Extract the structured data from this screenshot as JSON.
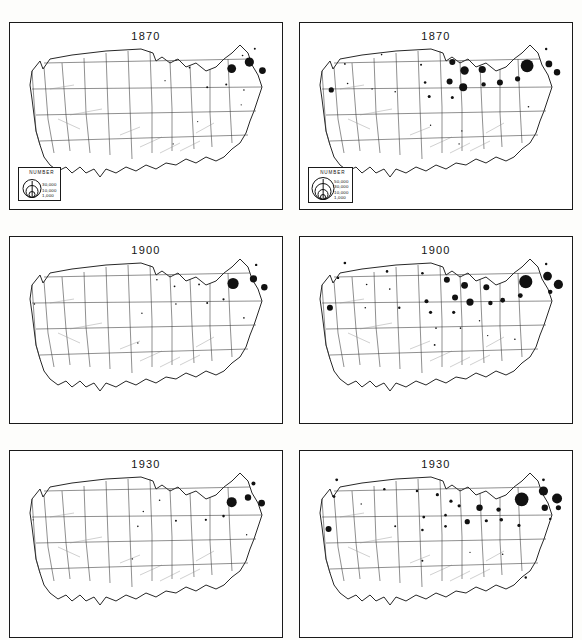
{
  "figure": {
    "title": "",
    "columns": [
      "left",
      "right"
    ],
    "rows": [
      "1870",
      "1900",
      "1930"
    ]
  },
  "chart_data": {
    "type": "scatter",
    "subtitle": "Proportional-symbol maps, two series, three time periods",
    "xlabel": "",
    "ylabel": "",
    "grid": false,
    "legend_position": "lower-left of top panels",
    "panels": [
      {
        "id": "p-1870-left",
        "row": 0,
        "col": 0,
        "title": "1870",
        "legend": {
          "title": "NUMBER",
          "entries": [
            "30,000",
            "10,000",
            "1,000"
          ],
          "values": [
            30000,
            10000,
            1000
          ]
        },
        "points": [
          {
            "x": 81.5,
            "y": 24.5,
            "r": 4.4
          },
          {
            "x": 88.0,
            "y": 21.0,
            "r": 4.6
          },
          {
            "x": 92.8,
            "y": 25.6,
            "r": 3.4
          },
          {
            "x": 90.0,
            "y": 13.8,
            "r": 1.0
          },
          {
            "x": 85.5,
            "y": 17.5,
            "r": 0.8
          },
          {
            "x": 79.5,
            "y": 33.0,
            "r": 1.0
          },
          {
            "x": 72.5,
            "y": 34.5,
            "r": 1.0
          },
          {
            "x": 86.0,
            "y": 36.0,
            "r": 0.8
          },
          {
            "x": 66.0,
            "y": 24.0,
            "r": 0.8
          },
          {
            "x": 61.0,
            "y": 20.0,
            "r": 0.7
          },
          {
            "x": 57.0,
            "y": 31.0,
            "r": 0.6
          },
          {
            "x": 69.0,
            "y": 53.0,
            "r": 0.6
          },
          {
            "x": 60.0,
            "y": 65.0,
            "r": 0.6
          },
          {
            "x": 85.0,
            "y": 44.0,
            "r": 0.6
          }
        ]
      },
      {
        "id": "p-1870-right",
        "row": 0,
        "col": 1,
        "title": "1870",
        "legend": {
          "title": "NUMBER",
          "entries": [
            "50,000",
            "30,000",
            "10,000",
            "1,000"
          ],
          "values": [
            50000,
            30000,
            10000,
            1000
          ]
        },
        "points": [
          {
            "x": 83.5,
            "y": 23.0,
            "r": 6.4
          },
          {
            "x": 91.5,
            "y": 22.0,
            "r": 3.4
          },
          {
            "x": 94.5,
            "y": 26.5,
            "r": 3.2
          },
          {
            "x": 90.5,
            "y": 14.0,
            "r": 1.2
          },
          {
            "x": 56.0,
            "y": 21.0,
            "r": 3.0
          },
          {
            "x": 60.5,
            "y": 25.5,
            "r": 4.2
          },
          {
            "x": 67.0,
            "y": 25.0,
            "r": 3.6
          },
          {
            "x": 55.0,
            "y": 31.5,
            "r": 3.0
          },
          {
            "x": 60.0,
            "y": 34.5,
            "r": 4.0
          },
          {
            "x": 67.5,
            "y": 33.0,
            "r": 2.2
          },
          {
            "x": 73.5,
            "y": 32.0,
            "r": 3.0
          },
          {
            "x": 80.0,
            "y": 30.0,
            "r": 2.6
          },
          {
            "x": 11.5,
            "y": 36.0,
            "r": 2.6
          },
          {
            "x": 46.0,
            "y": 32.0,
            "r": 1.3
          },
          {
            "x": 47.5,
            "y": 39.5,
            "r": 1.5
          },
          {
            "x": 56.0,
            "y": 40.0,
            "r": 1.5
          },
          {
            "x": 44.5,
            "y": 22.5,
            "r": 1.0
          },
          {
            "x": 30.0,
            "y": 17.0,
            "r": 0.8
          },
          {
            "x": 16.5,
            "y": 22.0,
            "r": 0.9
          },
          {
            "x": 17.5,
            "y": 32.5,
            "r": 0.8
          },
          {
            "x": 26.5,
            "y": 35.5,
            "r": 0.7
          },
          {
            "x": 35.0,
            "y": 37.0,
            "r": 0.8
          },
          {
            "x": 48.0,
            "y": 55.0,
            "r": 0.7
          },
          {
            "x": 59.5,
            "y": 58.0,
            "r": 0.7
          },
          {
            "x": 58.5,
            "y": 65.0,
            "r": 0.7
          },
          {
            "x": 84.0,
            "y": 45.0,
            "r": 0.8
          }
        ]
      },
      {
        "id": "p-1900-left",
        "row": 1,
        "col": 0,
        "title": "1900",
        "legend": null,
        "points": [
          {
            "x": 82.0,
            "y": 25.0,
            "r": 5.6
          },
          {
            "x": 89.5,
            "y": 22.5,
            "r": 3.6
          },
          {
            "x": 93.5,
            "y": 27.0,
            "r": 3.2
          },
          {
            "x": 90.5,
            "y": 15.0,
            "r": 1.2
          },
          {
            "x": 78.5,
            "y": 33.5,
            "r": 1.1
          },
          {
            "x": 72.5,
            "y": 35.5,
            "r": 1.0
          },
          {
            "x": 69.5,
            "y": 25.5,
            "r": 0.9
          },
          {
            "x": 60.5,
            "y": 26.5,
            "r": 0.9
          },
          {
            "x": 61.0,
            "y": 36.0,
            "r": 0.8
          },
          {
            "x": 54.0,
            "y": 23.0,
            "r": 0.8
          },
          {
            "x": 9.0,
            "y": 36.0,
            "r": 0.7
          },
          {
            "x": 48.5,
            "y": 41.0,
            "r": 0.7
          },
          {
            "x": 47.0,
            "y": 57.0,
            "r": 0.7
          },
          {
            "x": 86.0,
            "y": 43.5,
            "r": 0.8
          }
        ]
      },
      {
        "id": "p-1900-right",
        "row": 1,
        "col": 1,
        "title": "1900",
        "legend": null,
        "points": [
          {
            "x": 83.0,
            "y": 24.0,
            "r": 6.6
          },
          {
            "x": 91.0,
            "y": 21.0,
            "r": 4.4
          },
          {
            "x": 95.0,
            "y": 25.5,
            "r": 4.6
          },
          {
            "x": 92.0,
            "y": 29.5,
            "r": 2.2
          },
          {
            "x": 90.5,
            "y": 14.5,
            "r": 1.2
          },
          {
            "x": 54.0,
            "y": 23.0,
            "r": 3.0
          },
          {
            "x": 60.5,
            "y": 26.0,
            "r": 3.4
          },
          {
            "x": 68.5,
            "y": 27.0,
            "r": 3.0
          },
          {
            "x": 57.0,
            "y": 32.5,
            "r": 3.0
          },
          {
            "x": 62.5,
            "y": 35.0,
            "r": 3.6
          },
          {
            "x": 70.0,
            "y": 35.5,
            "r": 2.2
          },
          {
            "x": 74.5,
            "y": 34.0,
            "r": 2.4
          },
          {
            "x": 81.0,
            "y": 31.5,
            "r": 2.4
          },
          {
            "x": 11.0,
            "y": 38.0,
            "r": 3.0
          },
          {
            "x": 46.5,
            "y": 34.5,
            "r": 2.0
          },
          {
            "x": 48.0,
            "y": 40.5,
            "r": 1.6
          },
          {
            "x": 56.5,
            "y": 40.5,
            "r": 1.6
          },
          {
            "x": 45.0,
            "y": 19.5,
            "r": 1.3
          },
          {
            "x": 32.0,
            "y": 18.5,
            "r": 1.3
          },
          {
            "x": 16.5,
            "y": 14.0,
            "r": 1.3
          },
          {
            "x": 14.0,
            "y": 22.0,
            "r": 1.2
          },
          {
            "x": 24.5,
            "y": 25.5,
            "r": 0.8
          },
          {
            "x": 33.0,
            "y": 28.0,
            "r": 0.8
          },
          {
            "x": 36.5,
            "y": 38.0,
            "r": 1.2
          },
          {
            "x": 24.0,
            "y": 38.0,
            "r": 0.8
          },
          {
            "x": 50.0,
            "y": 49.0,
            "r": 0.8
          },
          {
            "x": 59.0,
            "y": 49.0,
            "r": 0.8
          },
          {
            "x": 49.5,
            "y": 58.0,
            "r": 0.9
          },
          {
            "x": 66.0,
            "y": 45.0,
            "r": 0.7
          },
          {
            "x": 69.0,
            "y": 53.0,
            "r": 0.7
          },
          {
            "x": 79.0,
            "y": 55.0,
            "r": 0.8
          }
        ]
      },
      {
        "id": "p-1930-left",
        "row": 2,
        "col": 0,
        "title": "1930",
        "legend": null,
        "points": [
          {
            "x": 81.5,
            "y": 27.5,
            "r": 5.0
          },
          {
            "x": 87.5,
            "y": 25.0,
            "r": 3.2
          },
          {
            "x": 92.5,
            "y": 28.0,
            "r": 3.4
          },
          {
            "x": 89.5,
            "y": 17.5,
            "r": 2.0
          },
          {
            "x": 78.5,
            "y": 35.0,
            "r": 1.3
          },
          {
            "x": 72.0,
            "y": 37.0,
            "r": 1.1
          },
          {
            "x": 61.0,
            "y": 37.5,
            "r": 1.0
          },
          {
            "x": 55.0,
            "y": 26.5,
            "r": 0.8
          },
          {
            "x": 49.0,
            "y": 32.5,
            "r": 0.7
          },
          {
            "x": 47.0,
            "y": 40.5,
            "r": 0.8
          },
          {
            "x": 8.5,
            "y": 37.0,
            "r": 0.6
          },
          {
            "x": 45.0,
            "y": 58.0,
            "r": 0.7
          },
          {
            "x": 87.0,
            "y": 45.0,
            "r": 0.7
          }
        ]
      },
      {
        "id": "p-1930-right",
        "row": 2,
        "col": 1,
        "title": "1930",
        "legend": null,
        "points": [
          {
            "x": 81.5,
            "y": 26.0,
            "r": 6.8
          },
          {
            "x": 89.5,
            "y": 21.5,
            "r": 4.6
          },
          {
            "x": 94.5,
            "y": 25.5,
            "r": 5.0
          },
          {
            "x": 90.0,
            "y": 30.5,
            "r": 3.2
          },
          {
            "x": 95.0,
            "y": 30.5,
            "r": 2.6
          },
          {
            "x": 92.0,
            "y": 36.5,
            "r": 1.2
          },
          {
            "x": 89.5,
            "y": 15.5,
            "r": 1.4
          },
          {
            "x": 73.0,
            "y": 31.5,
            "r": 2.2
          },
          {
            "x": 66.0,
            "y": 30.5,
            "r": 3.2
          },
          {
            "x": 58.5,
            "y": 29.5,
            "r": 1.6
          },
          {
            "x": 61.5,
            "y": 38.0,
            "r": 2.6
          },
          {
            "x": 68.5,
            "y": 37.5,
            "r": 1.6
          },
          {
            "x": 74.0,
            "y": 37.0,
            "r": 1.8
          },
          {
            "x": 80.5,
            "y": 40.0,
            "r": 1.6
          },
          {
            "x": 55.5,
            "y": 27.0,
            "r": 1.6
          },
          {
            "x": 50.5,
            "y": 23.5,
            "r": 1.6
          },
          {
            "x": 10.5,
            "y": 42.0,
            "r": 3.0
          },
          {
            "x": 45.5,
            "y": 35.5,
            "r": 1.4
          },
          {
            "x": 53.5,
            "y": 34.5,
            "r": 1.3
          },
          {
            "x": 53.5,
            "y": 40.5,
            "r": 1.3
          },
          {
            "x": 45.0,
            "y": 42.5,
            "r": 1.3
          },
          {
            "x": 43.0,
            "y": 21.5,
            "r": 1.2
          },
          {
            "x": 31.0,
            "y": 20.5,
            "r": 1.2
          },
          {
            "x": 13.5,
            "y": 15.5,
            "r": 1.4
          },
          {
            "x": 12.5,
            "y": 24.5,
            "r": 1.4
          },
          {
            "x": 35.0,
            "y": 40.5,
            "r": 1.0
          },
          {
            "x": 22.5,
            "y": 28.5,
            "r": 0.7
          },
          {
            "x": 45.0,
            "y": 59.0,
            "r": 1.0
          },
          {
            "x": 62.5,
            "y": 54.5,
            "r": 0.7
          },
          {
            "x": 74.5,
            "y": 55.5,
            "r": 0.8
          },
          {
            "x": 83.0,
            "y": 68.0,
            "r": 1.2
          }
        ]
      }
    ]
  }
}
